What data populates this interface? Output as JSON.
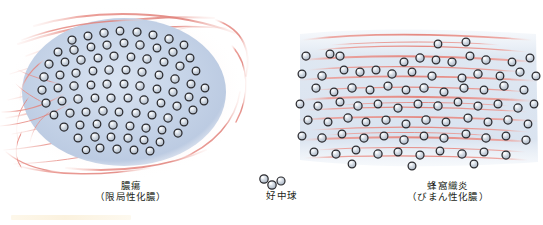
{
  "figure": {
    "title_absent": true,
    "panels": [
      {
        "id": "abscess",
        "caption_main": "膿瘍",
        "caption_sub": "（限局性化膿）",
        "description": "localized collection of neutrophils forming an oval abscess cavity surrounded by radiating connective tissue fibers"
      },
      {
        "id": "neutrophil-legend",
        "caption_main": "好中球",
        "caption_sub": "",
        "description": "legend showing a small cluster of three neutrophils"
      },
      {
        "id": "cellulitis",
        "caption_main": "蜂窩織炎",
        "caption_sub": "（びまん性化膿）",
        "description": "neutrophils diffusely scattered between horizontal bands of connective tissue fibers"
      }
    ]
  },
  "colors": {
    "cell_outline": "#2b2b2f",
    "cell_fill": "#c9d2dd",
    "cell_highlight": "#ffffff",
    "abscess_fill": "#c5d3e8",
    "fiber_pink": "#e8918a",
    "fiber_pale": "#f3c3bd",
    "tissue_haze": "#dde5f0",
    "caption_text": "#231f20",
    "bottom_bar": "#faefd8"
  }
}
